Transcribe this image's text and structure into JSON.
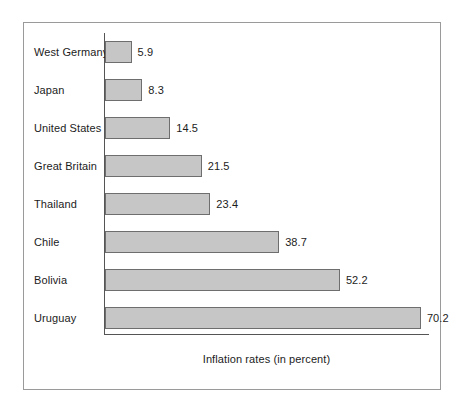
{
  "chart_data": {
    "type": "bar",
    "orientation": "horizontal",
    "title": "",
    "xlabel": "Inflation rates (in percent)",
    "ylabel": "",
    "categories": [
      "West Germany",
      "Japan",
      "United States",
      "Great Britain",
      "Thailand",
      "Chile",
      "Bolivia",
      "Uruguay"
    ],
    "values": [
      5.9,
      8.3,
      14.5,
      21.5,
      23.4,
      38.7,
      52.2,
      70.2
    ],
    "value_labels": [
      "5.9",
      "8.3",
      "14.5",
      "21.5",
      "23.4",
      "38.7",
      "52.2",
      "70.2"
    ],
    "xlim": [
      0,
      72
    ],
    "grid": false,
    "legend": null,
    "bar_color": "#c6c6c6",
    "bar_edge_color": "#6e6e6e",
    "axis_color": "#555555",
    "text_color": "#1c1c1c",
    "frame_color": "#9a9a9a",
    "background": "#ffffff"
  }
}
